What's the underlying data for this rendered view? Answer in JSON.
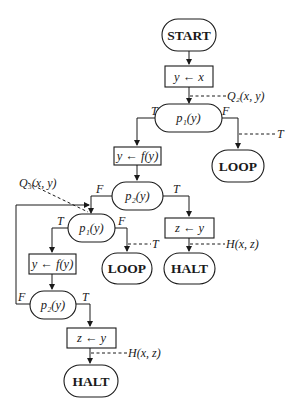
{
  "diagram": {
    "type": "flowchart",
    "nodes": {
      "start": {
        "label": "START",
        "shape": "terminal"
      },
      "assign_y_x": {
        "label": "y ← x",
        "shape": "box"
      },
      "test_p1_a": {
        "label": "p₁(y)",
        "shape": "test"
      },
      "loop_a": {
        "label": "LOOP",
        "shape": "terminal"
      },
      "assign_y_fy_a": {
        "label": "y ← f(y)",
        "shape": "box"
      },
      "test_p2_a": {
        "label": "p₂(y)",
        "shape": "test"
      },
      "assign_z_y_a": {
        "label": "z ← y",
        "shape": "box"
      },
      "halt_a": {
        "label": "HALT",
        "shape": "terminal"
      },
      "test_p1_b": {
        "label": "p₁(y)",
        "shape": "test"
      },
      "loop_b": {
        "label": "LOOP",
        "shape": "terminal"
      },
      "assign_y_fy_b": {
        "label": "y ← f(y)",
        "shape": "box"
      },
      "test_p2_b": {
        "label": "p₂(y)",
        "shape": "test"
      },
      "assign_z_y_b": {
        "label": "z ← y",
        "shape": "box"
      },
      "halt_b": {
        "label": "HALT",
        "shape": "terminal"
      }
    },
    "branch_labels": {
      "p1a_true": "T",
      "p1a_false": "F",
      "p2a_false": "F",
      "p2a_true": "T",
      "p1b_true": "T",
      "p1b_false": "F",
      "p2b_false": "F",
      "p2b_true": "T"
    },
    "assertions": {
      "q2": "Q₂(x, y)",
      "loop_a": "T",
      "q3": "Q₃(x, y)",
      "loop_b": "T",
      "halt_a": "H(x, z)",
      "halt_b": "H(x, z)"
    }
  }
}
